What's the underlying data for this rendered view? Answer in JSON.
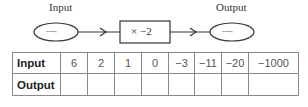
{
  "machine": {
    "input_label": "Input",
    "output_label": "Output",
    "input_placeholder": "......",
    "output_placeholder": "......",
    "operation": "× −2"
  },
  "table": {
    "row_headers": [
      "Input",
      "Output"
    ],
    "inputs": [
      "6",
      "2",
      "1",
      "0",
      "−3",
      "−11",
      "−20",
      "−1000"
    ],
    "outputs": [
      "",
      "",
      "",
      "",
      "",
      "",
      "",
      ""
    ]
  }
}
